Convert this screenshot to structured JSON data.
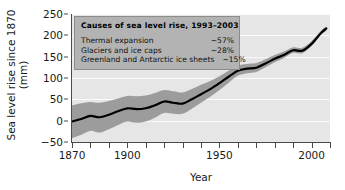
{
  "chart_data": {
    "type": "line",
    "title": "",
    "xlabel": "Year",
    "ylabel": "Sea level rise since 1870 (mm)",
    "ylabel_line1": "Sea level rise since 1870",
    "ylabel_line2": "(mm)",
    "xlim": [
      1870,
      2010
    ],
    "ylim": [
      -50,
      250
    ],
    "xticks": [
      1870,
      1900,
      1950,
      2000
    ],
    "xticks_minor_step": 10,
    "yticks": [
      -50,
      0,
      50,
      100,
      150,
      200,
      250
    ],
    "grid": true,
    "grid_color": "#fafafa",
    "plot_background": "#e6e6e6",
    "legend_position": "none",
    "series": [
      {
        "name": "Sea level rise",
        "line_color": "#000000",
        "band_color": "#9c9c9c",
        "x": [
          1870,
          1875,
          1880,
          1885,
          1890,
          1895,
          1900,
          1905,
          1910,
          1915,
          1920,
          1925,
          1930,
          1935,
          1940,
          1945,
          1950,
          1955,
          1960,
          1965,
          1970,
          1975,
          1980,
          1985,
          1990,
          1995,
          2000,
          2005,
          2008
        ],
        "values": [
          -2,
          4,
          11,
          8,
          14,
          22,
          29,
          27,
          29,
          36,
          45,
          42,
          40,
          50,
          62,
          74,
          88,
          103,
          117,
          122,
          124,
          134,
          145,
          154,
          165,
          164,
          180,
          205,
          216
        ],
        "band_lower": [
          -41,
          -33,
          -24,
          -28,
          -20,
          -10,
          -2,
          -5,
          -2,
          7,
          18,
          16,
          16,
          28,
          42,
          56,
          72,
          89,
          105,
          111,
          114,
          125,
          137,
          147,
          159,
          158,
          175,
          201,
          211
        ],
        "band_upper": [
          36,
          41,
          44,
          42,
          46,
          52,
          58,
          57,
          59,
          65,
          72,
          69,
          66,
          74,
          84,
          93,
          104,
          117,
          129,
          133,
          135,
          144,
          154,
          162,
          172,
          171,
          186,
          210,
          221
        ]
      }
    ]
  },
  "annotation": {
    "title": "Causes of sea level rise, 1993–2003",
    "rows": [
      {
        "label": "Thermal expansion",
        "value": "~57%"
      },
      {
        "label": "Glaciers and ice caps",
        "value": "~28%"
      },
      {
        "label": "Greenland and Antarctic ice sheets",
        "value": "~15%"
      }
    ]
  }
}
